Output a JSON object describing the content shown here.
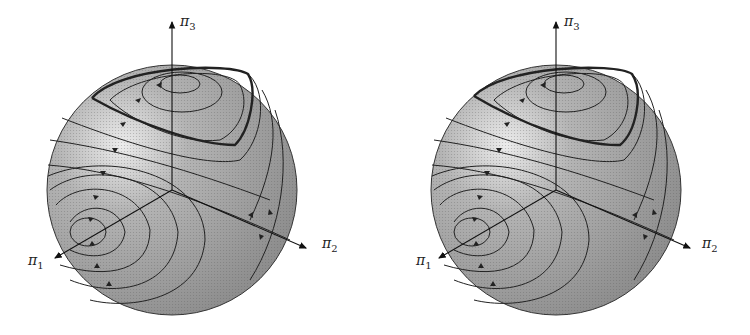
{
  "figure": {
    "panels": [
      {
        "id": "left",
        "axis_labels": {
          "x1": "π",
          "x1_sub": "1",
          "x2": "π",
          "x2_sub": "2",
          "x3": "π",
          "x3_sub": "3"
        },
        "description": "Sphere with phase portrait flow lines; thick separatrix near top"
      },
      {
        "id": "right",
        "axis_labels": {
          "x1": "π",
          "x1_sub": "1",
          "x2": "π",
          "x2_sub": "2",
          "x3": "π",
          "x3_sub": "3"
        },
        "description": "Sphere with phase portrait flow lines; thick separatrix near top (perturbed)"
      }
    ],
    "colors": {
      "sphere_fill": "#a8a8a8",
      "highlight": "#e8e8e8",
      "line": "#222222",
      "axis": "#111111"
    }
  }
}
